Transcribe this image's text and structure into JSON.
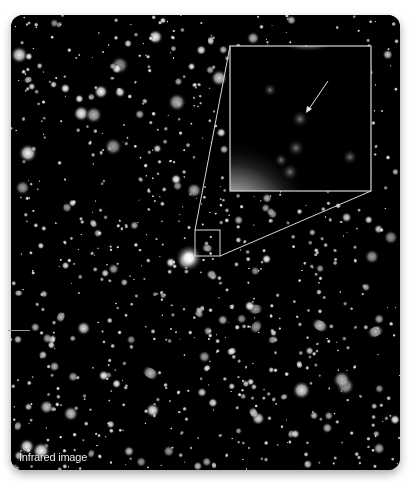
{
  "image": {
    "subject": "deep-field star and galaxy image",
    "caption": "Infrared image",
    "background_color": "#000000",
    "frame_color": "#ffffff"
  },
  "inset": {
    "description": "zoomed region with arrow pointing to faint object",
    "outline_color": "#d8d8d8",
    "arrow_color": "#e0e0e0"
  },
  "source_box": {
    "description": "small box marking zoomed region"
  }
}
